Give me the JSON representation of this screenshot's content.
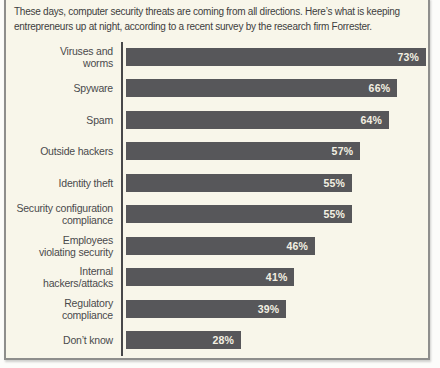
{
  "colors": {
    "page_background": "#fcfcfa",
    "panel_background": "#f8f6ea",
    "panel_border": "#8e8e8c",
    "bar": "#57575a",
    "bar_value_text": "#f3f0e2",
    "header_text": "#3e3e40",
    "label_text": "#4a4a4c",
    "axis_line": "#48484a"
  },
  "header": {
    "intro": "These days, computer security threats are coming from all directions. Here’s what is keeping\nentrepreneurs up at night, according to a recent survey by the research firm Forrester."
  },
  "chart_data": {
    "type": "bar",
    "orientation": "horizontal",
    "title": "",
    "categories": [
      "Viruses and\nworms",
      "Spyware",
      "Spam",
      "Outside hackers",
      "Identity theft",
      "Security configuration\ncompliance",
      "Employees\nviolating security",
      "Internal\nhackers/attacks",
      "Regulatory\ncompliance",
      "Don’t know"
    ],
    "values": [
      73,
      66,
      64,
      57,
      55,
      55,
      46,
      41,
      39,
      28
    ],
    "value_suffix": "%",
    "xlabel": "",
    "ylabel": "",
    "xlim": [
      0,
      73
    ],
    "grid": false,
    "legend": false,
    "data_labels": "inside-end"
  }
}
